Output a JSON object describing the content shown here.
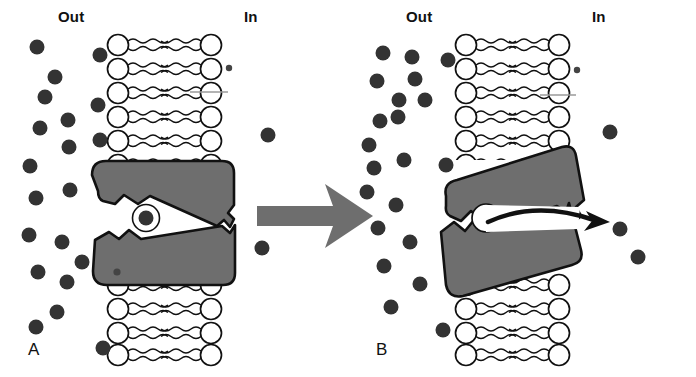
{
  "figure": {
    "width": 696,
    "height": 377,
    "background": "#ffffff"
  },
  "colors": {
    "particle": "#333333",
    "protein_fill": "#6e6e6e",
    "protein_outline": "#111111",
    "lipid_head_fill": "#ffffff",
    "lipid_outline": "#111111",
    "arrow_gray": "#6e6e6e",
    "arrow_black": "#111111",
    "text": "#111111"
  },
  "panels": [
    {
      "id": "a",
      "letter": "A",
      "state": "occluded-bound",
      "outside_label": "Out",
      "inside_label": "In",
      "protein": {
        "name": "carrier-protein",
        "tilt_deg": 0,
        "channel": "closed",
        "substrate_bound": true
      },
      "solute_particles_outside": 19,
      "solute_particles_inside": 2,
      "bilayer_lipid_rows": 10
    },
    {
      "id": "b",
      "letter": "B",
      "state": "open-releasing",
      "outside_label": "Out",
      "inside_label": "In",
      "protein": {
        "name": "carrier-protein",
        "tilt_deg": -12,
        "channel": "open",
        "substrate_bound": false
      },
      "solute_particles_outside": 19,
      "solute_particles_inside": 3,
      "bilayer_lipid_rows": 10,
      "release_arrow": "curved-arrow-pointing-in"
    }
  ],
  "center_arrow": {
    "name": "transition-arrow",
    "direction": "right",
    "meaning": "conformational change from A to B"
  },
  "icons": {
    "solute": "filled-circle-icon",
    "lipid": "phospholipid-icon",
    "transition": "block-arrow-right-icon",
    "release": "curved-arrow-icon"
  }
}
